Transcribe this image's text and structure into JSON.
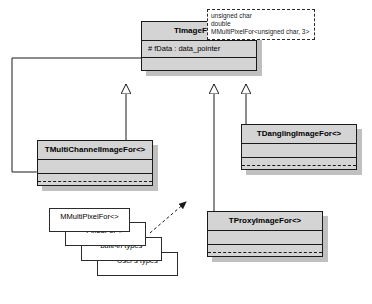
{
  "diagram": {
    "type": "uml-class-diagram",
    "background": "#ffffff",
    "class_fill": "#d4d4d4",
    "shadow_color": "#c0c0c0",
    "line_color": "#1a1a1a",
    "classes": [
      {
        "id": "timagefor",
        "name": "TImageFor<>",
        "attributes": "# fData : data_pointer",
        "operations": ""
      },
      {
        "id": "tmultichannelimagefor",
        "name": "TMultiChannelImageFor<>",
        "attributes": "",
        "operations": ""
      },
      {
        "id": "tdanglingimagefor",
        "name": "TDanglingImageFor<>",
        "attributes": "",
        "operations": ""
      },
      {
        "id": "tproxyimagefor",
        "name": "TProxyImageFor<>",
        "attributes": "",
        "operations": ""
      }
    ],
    "note": {
      "lines": [
        "unsigned char",
        "double",
        "MMultiPixelFor<unsigned char, 3>"
      ]
    },
    "type_boxes": [
      {
        "label": "MMultiPixelFor<>",
        "italic": false
      },
      {
        "label": "FixedFor<>",
        "italic": false
      },
      {
        "label": "built-in types",
        "italic": true
      },
      {
        "label": "User's types",
        "italic": true
      }
    ],
    "relations": [
      {
        "kind": "generalization",
        "from": "tmultichannelimagefor",
        "to": "timagefor"
      },
      {
        "kind": "generalization",
        "from": "tproxyimagefor",
        "to": "timagefor"
      },
      {
        "kind": "generalization",
        "from": "tdanglingimagefor",
        "to": "timagefor"
      },
      {
        "kind": "composition",
        "from": "timagefor",
        "to": "tmultichannelimagefor"
      },
      {
        "kind": "dependency",
        "from": "type_boxes",
        "to": "tproxyimagefor"
      },
      {
        "kind": "anchor",
        "from": "note",
        "to": "timagefor"
      }
    ]
  }
}
